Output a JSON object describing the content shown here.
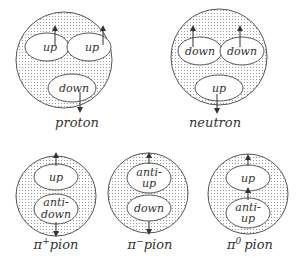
{
  "diagram": {
    "particles": [
      {
        "name": "proton",
        "label": "proton",
        "quarks": [
          "up",
          "up",
          "down"
        ],
        "spins": [
          "up",
          "up",
          "down"
        ]
      },
      {
        "name": "neutron",
        "label": "neutron",
        "quarks": [
          "down",
          "down",
          "up"
        ],
        "spins": [
          "up",
          "up",
          "down"
        ]
      },
      {
        "name": "pi-plus",
        "label_symbol": "π",
        "label_sup": "+",
        "label_text": "pion",
        "quarks": [
          "up",
          "anti-",
          "down"
        ],
        "spins": [
          "up",
          "down"
        ]
      },
      {
        "name": "pi-minus",
        "label_symbol": "π",
        "label_sup": "−",
        "label_text": "pion",
        "quarks": [
          "anti-",
          "up",
          "down"
        ],
        "spins": [
          "up",
          "down"
        ]
      },
      {
        "name": "pi-zero",
        "label_symbol": "π",
        "label_sup": "0",
        "label_text": "pion",
        "quarks": [
          "up",
          "anti-",
          "up"
        ],
        "spins": [
          "up",
          "up"
        ]
      }
    ],
    "colors": {
      "outline": "#555555",
      "dots": "#9a9a9a",
      "fill": "#ffffff",
      "text": "#333333"
    }
  }
}
